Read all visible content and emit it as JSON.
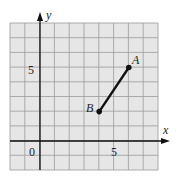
{
  "chart_data": {
    "type": "line",
    "title": "",
    "xlabel": "x",
    "ylabel": "y",
    "xlim": [
      -2,
      8
    ],
    "ylim": [
      -2,
      8
    ],
    "grid": true,
    "x_ticks_labeled": [
      {
        "value": 0,
        "label": "0"
      },
      {
        "value": 5,
        "label": "5"
      }
    ],
    "y_ticks_labeled": [
      {
        "value": 5,
        "label": "5"
      }
    ],
    "points": [
      {
        "name": "A",
        "x": 6,
        "y": 5
      },
      {
        "name": "B",
        "x": 4,
        "y": 2
      }
    ],
    "segments": [
      {
        "from": "B",
        "to": "A"
      }
    ]
  },
  "labels": {
    "x_axis": "x",
    "y_axis": "y",
    "origin": "0",
    "x_tick_5": "5",
    "y_tick_5": "5",
    "point_a": "A",
    "point_b": "B"
  },
  "colors": {
    "grid_bg": "#e6e6e6",
    "grid_line": "#9a9a9a",
    "axis": "#111111",
    "segment": "#111111"
  }
}
